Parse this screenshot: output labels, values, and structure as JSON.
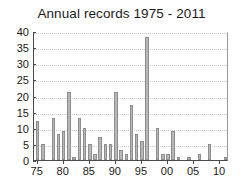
{
  "chart_data": {
    "type": "bar",
    "title": "Annual records 1975 - 2011",
    "xlabel": "",
    "ylabel": "",
    "grid": true,
    "legend": false,
    "xlim": [
      1974.3,
      2011.7
    ],
    "ylim": [
      0,
      40
    ],
    "ytick_values": [
      0,
      5,
      10,
      15,
      20,
      25,
      30,
      35,
      40
    ],
    "ytick_labels": [
      "0",
      "5",
      "10",
      "15",
      "20",
      "25",
      "30",
      "35",
      "40"
    ],
    "xtick_values": [
      1975,
      1980,
      1985,
      1990,
      1995,
      2000,
      2005,
      2010
    ],
    "xtick_labels": [
      "75",
      "80",
      "85",
      "90",
      "95",
      "00",
      "05",
      "10"
    ],
    "categories": [
      "1975",
      "1976",
      "1977",
      "1978",
      "1979",
      "1980",
      "1981",
      "1982",
      "1983",
      "1984",
      "1985",
      "1986",
      "1987",
      "1988",
      "1989",
      "1990",
      "1991",
      "1992",
      "1993",
      "1994",
      "1995",
      "1996",
      "1997",
      "1998",
      "1999",
      "2000",
      "2001",
      "2002",
      "2003",
      "2004",
      "2005",
      "2006",
      "2007",
      "2008",
      "2009",
      "2010",
      "2011"
    ],
    "values": [
      12,
      5,
      0,
      13,
      8,
      9,
      21,
      1,
      13,
      10,
      5,
      2,
      7,
      5,
      5,
      21,
      3,
      2,
      17,
      8,
      6,
      38,
      0,
      10,
      2,
      2,
      9,
      1,
      0,
      1,
      0,
      2,
      0,
      5,
      0,
      0,
      1
    ],
    "bar_color": "#b6b6b6",
    "bar_edge_color": "#8e8e8e",
    "axis_color": "#4a4a4a",
    "grid_color": "#c9c9c9",
    "text_color": "#1a1a1a",
    "background_color": "#ffffff"
  }
}
